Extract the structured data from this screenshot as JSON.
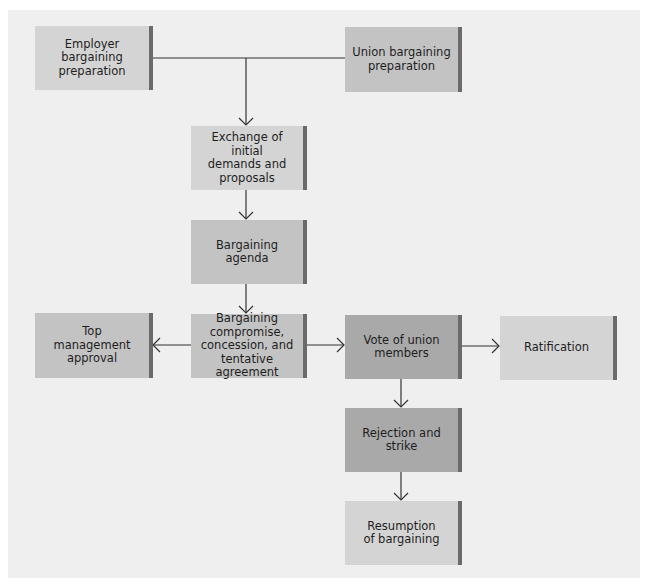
{
  "diagram": {
    "type": "flowchart",
    "nodes": [
      {
        "id": "employer",
        "label": "Employer\nbargaining\npreparation",
        "shade": "light"
      },
      {
        "id": "union",
        "label": "Union bargaining\npreparation",
        "shade": "mid"
      },
      {
        "id": "exchange",
        "label": "Exchange of initial\ndemands and\nproposals",
        "shade": "light"
      },
      {
        "id": "agenda",
        "label": "Bargaining\nagenda",
        "shade": "mid"
      },
      {
        "id": "compromise",
        "label": "Bargaining\ncompromise,\nconcession, and\ntentative agreement",
        "shade": "mid"
      },
      {
        "id": "top_mgmt",
        "label": "Top\nmanagement\napproval",
        "shade": "mid"
      },
      {
        "id": "vote",
        "label": "Vote of union\nmembers",
        "shade": "dark"
      },
      {
        "id": "ratification",
        "label": "Ratification",
        "shade": "light"
      },
      {
        "id": "rejection",
        "label": "Rejection and\nstrike",
        "shade": "dark"
      },
      {
        "id": "resumption",
        "label": "Resumption\nof bargaining",
        "shade": "light"
      }
    ],
    "edges": [
      {
        "from": "employer",
        "to": "exchange"
      },
      {
        "from": "union",
        "to": "exchange"
      },
      {
        "from": "exchange",
        "to": "agenda"
      },
      {
        "from": "agenda",
        "to": "compromise"
      },
      {
        "from": "compromise",
        "to": "top_mgmt"
      },
      {
        "from": "compromise",
        "to": "vote"
      },
      {
        "from": "vote",
        "to": "ratification"
      },
      {
        "from": "vote",
        "to": "rejection"
      },
      {
        "from": "rejection",
        "to": "resumption"
      }
    ],
    "colors": {
      "background": "#efefef",
      "box_light": "#d4d4d4",
      "box_mid": "#c3c3c3",
      "box_dark": "#a9a9a9",
      "box_edge": "#6a6a6a",
      "line": "#333333"
    }
  }
}
